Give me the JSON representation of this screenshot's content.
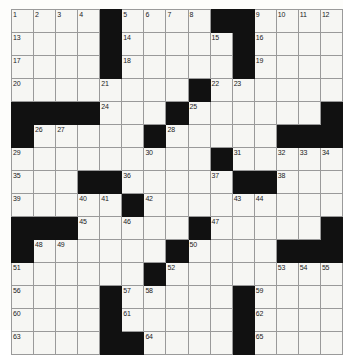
{
  "puzzle": {
    "name": "crossword-grid",
    "rows": 14,
    "columns": 13,
    "cell_size_px": 24,
    "colors": {
      "block": "#111111",
      "cell": "#f6f6f3",
      "grid_line": "#9a9a9a",
      "number_text": "#1b1b1b",
      "page_background": "#fdfdfb"
    },
    "grid": [
      [
        {
          "type": "open",
          "number": "1"
        },
        {
          "type": "open",
          "number": "2"
        },
        {
          "type": "open",
          "number": "3"
        },
        {
          "type": "open",
          "number": "4"
        },
        {
          "type": "block",
          "number": ""
        },
        {
          "type": "open",
          "number": "5"
        },
        {
          "type": "open",
          "number": "6"
        },
        {
          "type": "open",
          "number": "7"
        },
        {
          "type": "open",
          "number": "8"
        },
        {
          "type": "block",
          "number": ""
        },
        {
          "type": "block",
          "number": ""
        },
        {
          "type": "open",
          "number": "9"
        },
        {
          "type": "open",
          "number": "10"
        },
        {
          "type": "open",
          "number": "11"
        },
        {
          "type": "open",
          "number": "12"
        }
      ],
      [
        {
          "type": "open",
          "number": "13"
        },
        {
          "type": "open",
          "number": ""
        },
        {
          "type": "open",
          "number": ""
        },
        {
          "type": "open",
          "number": ""
        },
        {
          "type": "block",
          "number": ""
        },
        {
          "type": "open",
          "number": "14"
        },
        {
          "type": "open",
          "number": ""
        },
        {
          "type": "open",
          "number": ""
        },
        {
          "type": "open",
          "number": ""
        },
        {
          "type": "open",
          "number": "15"
        },
        {
          "type": "block",
          "number": ""
        },
        {
          "type": "open",
          "number": "16"
        },
        {
          "type": "open",
          "number": ""
        },
        {
          "type": "open",
          "number": ""
        },
        {
          "type": "open",
          "number": ""
        }
      ],
      [
        {
          "type": "open",
          "number": "17"
        },
        {
          "type": "open",
          "number": ""
        },
        {
          "type": "open",
          "number": ""
        },
        {
          "type": "open",
          "number": ""
        },
        {
          "type": "block",
          "number": ""
        },
        {
          "type": "open",
          "number": "18"
        },
        {
          "type": "open",
          "number": ""
        },
        {
          "type": "open",
          "number": ""
        },
        {
          "type": "open",
          "number": ""
        },
        {
          "type": "open",
          "number": ""
        },
        {
          "type": "block",
          "number": ""
        },
        {
          "type": "open",
          "number": "19"
        },
        {
          "type": "open",
          "number": ""
        },
        {
          "type": "open",
          "number": ""
        },
        {
          "type": "open",
          "number": ""
        }
      ],
      [
        {
          "type": "open",
          "number": "20"
        },
        {
          "type": "open",
          "number": ""
        },
        {
          "type": "open",
          "number": ""
        },
        {
          "type": "open",
          "number": ""
        },
        {
          "type": "open",
          "number": "21"
        },
        {
          "type": "open",
          "number": ""
        },
        {
          "type": "open",
          "number": ""
        },
        {
          "type": "open",
          "number": ""
        },
        {
          "type": "block",
          "number": ""
        },
        {
          "type": "open",
          "number": "22"
        },
        {
          "type": "open",
          "number": "23"
        },
        {
          "type": "open",
          "number": ""
        },
        {
          "type": "open",
          "number": ""
        },
        {
          "type": "open",
          "number": ""
        },
        {
          "type": "open",
          "number": ""
        }
      ],
      [
        {
          "type": "block",
          "number": ""
        },
        {
          "type": "block",
          "number": ""
        },
        {
          "type": "block",
          "number": ""
        },
        {
          "type": "block",
          "number": ""
        },
        {
          "type": "open",
          "number": "24"
        },
        {
          "type": "open",
          "number": ""
        },
        {
          "type": "open",
          "number": ""
        },
        {
          "type": "block",
          "number": ""
        },
        {
          "type": "open",
          "number": "25"
        },
        {
          "type": "open",
          "number": ""
        },
        {
          "type": "open",
          "number": ""
        },
        {
          "type": "open",
          "number": ""
        },
        {
          "type": "open",
          "number": ""
        },
        {
          "type": "open",
          "number": ""
        },
        {
          "type": "block",
          "number": ""
        }
      ],
      [
        {
          "type": "block",
          "number": ""
        },
        {
          "type": "open",
          "number": "26"
        },
        {
          "type": "open",
          "number": "27"
        },
        {
          "type": "open",
          "number": ""
        },
        {
          "type": "open",
          "number": ""
        },
        {
          "type": "open",
          "number": ""
        },
        {
          "type": "block",
          "number": ""
        },
        {
          "type": "open",
          "number": "28"
        },
        {
          "type": "open",
          "number": ""
        },
        {
          "type": "open",
          "number": ""
        },
        {
          "type": "open",
          "number": ""
        },
        {
          "type": "open",
          "number": ""
        },
        {
          "type": "block",
          "number": ""
        },
        {
          "type": "block",
          "number": ""
        },
        {
          "type": "block",
          "number": ""
        }
      ],
      [
        {
          "type": "open",
          "number": "29"
        },
        {
          "type": "open",
          "number": ""
        },
        {
          "type": "open",
          "number": ""
        },
        {
          "type": "open",
          "number": ""
        },
        {
          "type": "open",
          "number": ""
        },
        {
          "type": "open",
          "number": ""
        },
        {
          "type": "open",
          "number": "30"
        },
        {
          "type": "open",
          "number": ""
        },
        {
          "type": "open",
          "number": ""
        },
        {
          "type": "block",
          "number": ""
        },
        {
          "type": "open",
          "number": "31"
        },
        {
          "type": "open",
          "number": ""
        },
        {
          "type": "open",
          "number": "32"
        },
        {
          "type": "open",
          "number": "33"
        },
        {
          "type": "open",
          "number": "34"
        }
      ],
      [
        {
          "type": "open",
          "number": "35"
        },
        {
          "type": "open",
          "number": ""
        },
        {
          "type": "open",
          "number": ""
        },
        {
          "type": "block",
          "number": ""
        },
        {
          "type": "block",
          "number": ""
        },
        {
          "type": "open",
          "number": "36"
        },
        {
          "type": "open",
          "number": ""
        },
        {
          "type": "open",
          "number": ""
        },
        {
          "type": "open",
          "number": ""
        },
        {
          "type": "open",
          "number": "37"
        },
        {
          "type": "block",
          "number": ""
        },
        {
          "type": "block",
          "number": ""
        },
        {
          "type": "open",
          "number": "38"
        },
        {
          "type": "open",
          "number": ""
        },
        {
          "type": "open",
          "number": ""
        }
      ],
      [
        {
          "type": "open",
          "number": "39"
        },
        {
          "type": "open",
          "number": ""
        },
        {
          "type": "open",
          "number": ""
        },
        {
          "type": "open",
          "number": "40"
        },
        {
          "type": "open",
          "number": "41"
        },
        {
          "type": "block",
          "number": ""
        },
        {
          "type": "open",
          "number": "42"
        },
        {
          "type": "open",
          "number": ""
        },
        {
          "type": "open",
          "number": ""
        },
        {
          "type": "open",
          "number": ""
        },
        {
          "type": "open",
          "number": "43"
        },
        {
          "type": "open",
          "number": "44"
        },
        {
          "type": "open",
          "number": ""
        },
        {
          "type": "open",
          "number": ""
        },
        {
          "type": "open",
          "number": ""
        }
      ],
      [
        {
          "type": "block",
          "number": ""
        },
        {
          "type": "block",
          "number": ""
        },
        {
          "type": "block",
          "number": ""
        },
        {
          "type": "open",
          "number": "45"
        },
        {
          "type": "open",
          "number": ""
        },
        {
          "type": "open",
          "number": "46"
        },
        {
          "type": "open",
          "number": ""
        },
        {
          "type": "open",
          "number": ""
        },
        {
          "type": "block",
          "number": ""
        },
        {
          "type": "open",
          "number": "47"
        },
        {
          "type": "open",
          "number": ""
        },
        {
          "type": "open",
          "number": ""
        },
        {
          "type": "open",
          "number": ""
        },
        {
          "type": "open",
          "number": ""
        },
        {
          "type": "block",
          "number": ""
        }
      ],
      [
        {
          "type": "block",
          "number": ""
        },
        {
          "type": "open",
          "number": "48"
        },
        {
          "type": "open",
          "number": "49"
        },
        {
          "type": "open",
          "number": ""
        },
        {
          "type": "open",
          "number": ""
        },
        {
          "type": "open",
          "number": ""
        },
        {
          "type": "open",
          "number": ""
        },
        {
          "type": "block",
          "number": ""
        },
        {
          "type": "open",
          "number": "50"
        },
        {
          "type": "open",
          "number": ""
        },
        {
          "type": "open",
          "number": ""
        },
        {
          "type": "open",
          "number": ""
        },
        {
          "type": "block",
          "number": ""
        },
        {
          "type": "block",
          "number": ""
        },
        {
          "type": "block",
          "number": ""
        }
      ],
      [
        {
          "type": "open",
          "number": "51"
        },
        {
          "type": "open",
          "number": ""
        },
        {
          "type": "open",
          "number": ""
        },
        {
          "type": "open",
          "number": ""
        },
        {
          "type": "open",
          "number": ""
        },
        {
          "type": "open",
          "number": ""
        },
        {
          "type": "block",
          "number": ""
        },
        {
          "type": "open",
          "number": "52"
        },
        {
          "type": "open",
          "number": ""
        },
        {
          "type": "open",
          "number": ""
        },
        {
          "type": "open",
          "number": ""
        },
        {
          "type": "open",
          "number": ""
        },
        {
          "type": "open",
          "number": "53"
        },
        {
          "type": "open",
          "number": "54"
        },
        {
          "type": "open",
          "number": "55"
        }
      ],
      [
        {
          "type": "open",
          "number": "56"
        },
        {
          "type": "open",
          "number": ""
        },
        {
          "type": "open",
          "number": ""
        },
        {
          "type": "open",
          "number": ""
        },
        {
          "type": "block",
          "number": ""
        },
        {
          "type": "open",
          "number": "57"
        },
        {
          "type": "open",
          "number": "58"
        },
        {
          "type": "open",
          "number": ""
        },
        {
          "type": "open",
          "number": ""
        },
        {
          "type": "open",
          "number": ""
        },
        {
          "type": "block",
          "number": ""
        },
        {
          "type": "open",
          "number": "59"
        },
        {
          "type": "open",
          "number": ""
        },
        {
          "type": "open",
          "number": ""
        },
        {
          "type": "open",
          "number": ""
        }
      ],
      [
        {
          "type": "open",
          "number": "60"
        },
        {
          "type": "open",
          "number": ""
        },
        {
          "type": "open",
          "number": ""
        },
        {
          "type": "open",
          "number": ""
        },
        {
          "type": "block",
          "number": ""
        },
        {
          "type": "open",
          "number": "61"
        },
        {
          "type": "open",
          "number": ""
        },
        {
          "type": "open",
          "number": ""
        },
        {
          "type": "open",
          "number": ""
        },
        {
          "type": "open",
          "number": ""
        },
        {
          "type": "block",
          "number": ""
        },
        {
          "type": "open",
          "number": "62"
        },
        {
          "type": "open",
          "number": ""
        },
        {
          "type": "open",
          "number": ""
        },
        {
          "type": "open",
          "number": ""
        }
      ],
      [
        {
          "type": "open",
          "number": "63"
        },
        {
          "type": "open",
          "number": ""
        },
        {
          "type": "open",
          "number": ""
        },
        {
          "type": "open",
          "number": ""
        },
        {
          "type": "block",
          "number": ""
        },
        {
          "type": "block",
          "number": ""
        },
        {
          "type": "open",
          "number": "64"
        },
        {
          "type": "open",
          "number": ""
        },
        {
          "type": "open",
          "number": ""
        },
        {
          "type": "open",
          "number": ""
        },
        {
          "type": "block",
          "number": ""
        },
        {
          "type": "open",
          "number": "65"
        },
        {
          "type": "open",
          "number": ""
        },
        {
          "type": "open",
          "number": ""
        },
        {
          "type": "open",
          "number": ""
        }
      ]
    ]
  }
}
